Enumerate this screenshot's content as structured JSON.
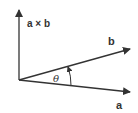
{
  "diagram": {
    "title": "",
    "colors": {
      "stroke": "#333333",
      "background": "#ffffff"
    },
    "vectors": [
      {
        "id": "cross",
        "label": "a × b",
        "from": [
          19,
          80
        ],
        "to": [
          19,
          9
        ]
      },
      {
        "id": "b",
        "label": "b",
        "from": [
          19,
          80
        ],
        "to": [
          131,
          49
        ]
      },
      {
        "id": "a",
        "label": "a",
        "from": [
          19,
          80
        ],
        "to": [
          131,
          92
        ]
      }
    ],
    "angle": {
      "label": "θ",
      "between": [
        "a",
        "b"
      ],
      "direction": "counterclockwise from a to b"
    }
  }
}
